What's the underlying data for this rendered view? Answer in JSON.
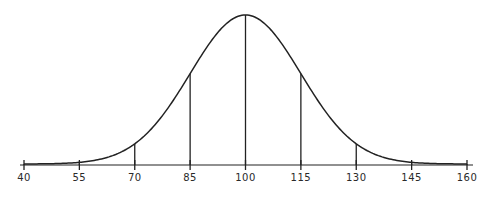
{
  "chart_data": {
    "type": "line",
    "title": "",
    "subtitle": "",
    "xlabel": "",
    "ylabel": "",
    "distribution": {
      "mean": 100,
      "sd": 15
    },
    "xlim": [
      40,
      160
    ],
    "ylim": [
      0,
      1
    ],
    "grid": false,
    "legend": null,
    "x_ticks": [
      40,
      55,
      70,
      85,
      100,
      115,
      130,
      145,
      160
    ],
    "x_tick_labels": [
      "40",
      "55",
      "70",
      "85",
      "100",
      "115",
      "130",
      "145",
      "160"
    ],
    "vertical_lines_at": [
      40,
      55,
      70,
      85,
      100,
      115,
      130,
      145,
      160
    ],
    "series": [
      {
        "name": "normal curve",
        "x": [
          40,
          55,
          70,
          85,
          100,
          115,
          130,
          145,
          160
        ],
        "values": [
          0.0003,
          0.011,
          0.135,
          0.607,
          1.0,
          0.607,
          0.135,
          0.011,
          0.0003
        ]
      }
    ],
    "colors": {
      "line": "#222222",
      "background": "#ffffff",
      "text": "#2a2a2a"
    }
  }
}
